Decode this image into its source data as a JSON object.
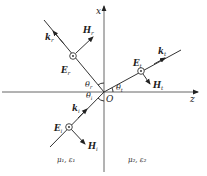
{
  "axes": {
    "x_label": "x",
    "z_label": "z",
    "origin_label": "O"
  },
  "rays": {
    "incident": {
      "k_label": "k",
      "k_sub": "i",
      "E_label": "E",
      "E_sub": "i",
      "H_label": "H",
      "H_sub": "i",
      "angle_label": "θ",
      "angle_sub": "i"
    },
    "reflected": {
      "k_label": "k",
      "k_sub": "r",
      "E_label": "E",
      "E_sub": "r",
      "H_label": "H",
      "H_sub": "r",
      "angle_label": "θ",
      "angle_sub": "r"
    },
    "transmitted": {
      "k_label": "k",
      "k_sub": "t",
      "E_label": "E",
      "E_sub": "t",
      "H_label": "H",
      "H_sub": "t",
      "angle_label": "θ",
      "angle_sub": "t"
    }
  },
  "media": {
    "medium1": "μ₁, ε₁",
    "medium2": "μ₂, ε₂"
  },
  "colors": {
    "line": "#333333",
    "text": "#222222",
    "background": "#ffffff"
  }
}
